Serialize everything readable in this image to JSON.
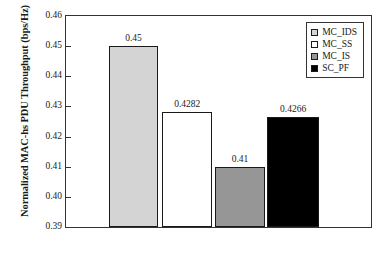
{
  "chart_data": {
    "type": "bar",
    "title": "",
    "xlabel": "",
    "ylabel": "Normalized MAC-hs PDU Throughput (bps/Hz)",
    "categories": [
      "MC_IDS",
      "MC_SS",
      "MC_IS",
      "SC_PF"
    ],
    "values": [
      0.45,
      0.4282,
      0.41,
      0.4266
    ],
    "value_labels": [
      "0.45",
      "0.4282",
      "0.41",
      "0.4266"
    ],
    "bar_colors": [
      "#d4d4d4",
      "#ffffff",
      "#969696",
      "#000000"
    ],
    "ylim": [
      0.39,
      0.46
    ],
    "ytick_labels": [
      "0.46",
      "0.45",
      "0.44",
      "0.43",
      "0.42",
      "0.41",
      "0.40",
      "0.39"
    ],
    "ytick_values": [
      0.46,
      0.45,
      0.44,
      0.43,
      0.42,
      0.41,
      0.4,
      0.39
    ],
    "xtick_labels": [],
    "grid": false,
    "legend_position": "top-right",
    "legend": [
      {
        "label": "MC_IDS",
        "color": "#d4d4d4"
      },
      {
        "label": "MC_SS",
        "color": "#ffffff"
      },
      {
        "label": "MC_IS",
        "color": "#969696"
      },
      {
        "label": "SC_PF",
        "color": "#000000"
      }
    ],
    "axis_color": "#333333",
    "bar_edge_color": "#1a1a1a",
    "bar_geometry": [
      {
        "left_pct": 14.0,
        "width_pct": 16.3
      },
      {
        "left_pct": 31.6,
        "width_pct": 16.3
      },
      {
        "left_pct": 48.9,
        "width_pct": 16.3
      },
      {
        "left_pct": 65.8,
        "width_pct": 17.3
      }
    ]
  }
}
